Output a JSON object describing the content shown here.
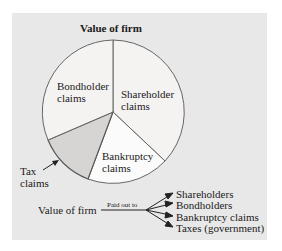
{
  "title": "Value of firm",
  "slices": [
    {
      "label_line1": "Shareholder",
      "label_line2": "claims"
    },
    {
      "label_line1": "Bankruptcy",
      "label_line2": "claims"
    },
    {
      "label_line1": "Tax",
      "label_line2": "claims"
    },
    {
      "label_line1": "Bondholder",
      "label_line2": "claims"
    }
  ],
  "flow": {
    "source": "Value of firm",
    "arrow_label": "Paid out to",
    "targets": [
      "Shareholders",
      "Bondholders",
      "Bankruptcy claims",
      "Taxes (government)"
    ]
  },
  "colors": {
    "panel": "#e9e8e8",
    "slice_light": "#f4f3f2",
    "slice_white": "#fbfbfb",
    "slice_tax": "#d6d5d4",
    "line": "#555555"
  }
}
